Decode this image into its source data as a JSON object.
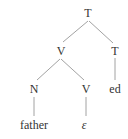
{
  "tree": {
    "root": {
      "label": "T"
    },
    "v_phrase": {
      "label": "V"
    },
    "t_right": {
      "label": "T"
    },
    "n_node": {
      "label": "N"
    },
    "v_node": {
      "label": "V"
    },
    "suffix": {
      "label": "ed"
    },
    "leaf_father": {
      "label": "father"
    },
    "leaf_empty": {
      "label": "ε"
    }
  },
  "colors": {
    "line": "#8a8a8a",
    "text": "#333333"
  }
}
